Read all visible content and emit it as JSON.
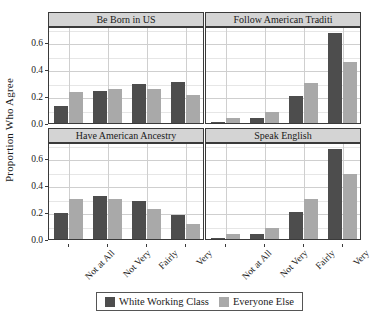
{
  "chart_data": {
    "type": "bar",
    "title": "",
    "xlabel": "",
    "ylabel": "Proportion Who Agree",
    "categories": [
      "Not at All",
      "Not Very",
      "Fairly",
      "Very"
    ],
    "ylim": [
      0,
      0.72
    ],
    "yticks": [
      "0.0",
      "0.2",
      "0.4",
      "0.6"
    ],
    "ytick_values": [
      0.0,
      0.2,
      0.4,
      0.6
    ],
    "grid": true,
    "legend_position": "bottom",
    "series_names": [
      "White Working Class",
      "Everyone Else"
    ],
    "colors": {
      "white_working_class": "#4d4d4d",
      "everyone_else": "#a9a9a9",
      "strip_background": "#d4d4d4",
      "panel_background": "#ffffff",
      "gridline": "#cfcfcf",
      "border": "#3a3a3a"
    },
    "panels": [
      {
        "title": "Be Born in US",
        "series": [
          {
            "name": "White Working Class",
            "values": [
              0.13,
              0.235,
              0.29,
              0.305
            ]
          },
          {
            "name": "Everyone Else",
            "values": [
              0.23,
              0.255,
              0.25,
              0.205
            ]
          }
        ]
      },
      {
        "title": "Follow American Traditi",
        "series": [
          {
            "name": "White Working Class",
            "values": [
              0.005,
              0.04,
              0.2,
              0.67
            ]
          },
          {
            "name": "Everyone Else",
            "values": [
              0.035,
              0.08,
              0.295,
              0.455
            ]
          }
        ]
      },
      {
        "title": "Have American Ancestry",
        "series": [
          {
            "name": "White Working Class",
            "values": [
              0.19,
              0.32,
              0.28,
              0.18
            ]
          },
          {
            "name": "Everyone Else",
            "values": [
              0.3,
              0.3,
              0.22,
              0.11
            ]
          }
        ]
      },
      {
        "title": "Speak English",
        "series": [
          {
            "name": "White Working Class",
            "values": [
              0.005,
              0.04,
              0.2,
              0.67
            ]
          },
          {
            "name": "Everyone Else",
            "values": [
              0.035,
              0.08,
              0.295,
              0.48
            ]
          }
        ]
      }
    ]
  },
  "legend": {
    "items": [
      {
        "label": "White Working Class",
        "key": "wwc"
      },
      {
        "label": "Everyone Else",
        "key": "ee"
      }
    ]
  }
}
